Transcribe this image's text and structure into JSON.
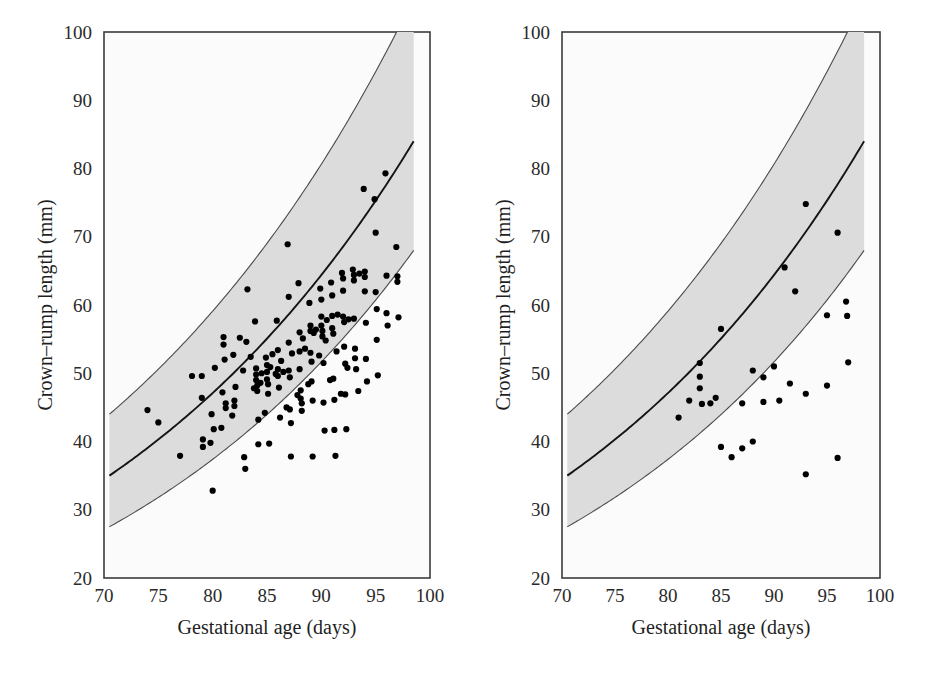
{
  "figure": {
    "background_color": "#ffffff",
    "panel_count": 2
  },
  "chart_data": [
    {
      "type": "scatter",
      "panel": "left",
      "title": "",
      "xlabel": "Gestational age (days)",
      "ylabel": "Crown–rump length (mm)",
      "xlim": [
        70,
        100
      ],
      "ylim": [
        20,
        100
      ],
      "xticks": [
        70,
        75,
        80,
        85,
        90,
        95,
        100
      ],
      "yticks": [
        20,
        30,
        40,
        50,
        60,
        70,
        80,
        90,
        100
      ],
      "grid": false,
      "legend": "none",
      "band": {
        "label": "reference centile band",
        "fill_color": "#dcdcdc",
        "edge_color": "#4a4a4a",
        "median_color": "#141414",
        "x_start": 70.5,
        "x_end": 98.5,
        "median_start": 35,
        "median_end": 84,
        "upper_start": 44,
        "upper_end": 105,
        "lower_start": 27.5,
        "lower_end": 68
      },
      "series": [
        {
          "name": "observations",
          "marker": "filled-circle",
          "color": "#000000",
          "points": [
            [
              74.0,
              44.6
            ],
            [
              75.0,
              42.8
            ],
            [
              77.0,
              37.9
            ],
            [
              78.1,
              49.6
            ],
            [
              79.0,
              49.6
            ],
            [
              79.0,
              46.4
            ],
            [
              79.1,
              40.3
            ],
            [
              79.1,
              39.2
            ],
            [
              79.9,
              44.0
            ],
            [
              80.0,
              32.8
            ],
            [
              80.1,
              41.8
            ],
            [
              80.2,
              50.8
            ],
            [
              80.9,
              47.2
            ],
            [
              81.0,
              55.3
            ],
            [
              81.0,
              54.2
            ],
            [
              81.1,
              52.0
            ],
            [
              81.2,
              45.6
            ],
            [
              81.2,
              44.9
            ],
            [
              81.9,
              52.7
            ],
            [
              82.0,
              46.0
            ],
            [
              82.0,
              45.2
            ],
            [
              82.1,
              48.0
            ],
            [
              82.9,
              37.7
            ],
            [
              83.0,
              36.0
            ],
            [
              83.1,
              54.6
            ],
            [
              83.2,
              62.3
            ],
            [
              83.9,
              57.6
            ],
            [
              84.0,
              50.7
            ],
            [
              84.0,
              49.8
            ],
            [
              84.0,
              49.0
            ],
            [
              84.1,
              48.2
            ],
            [
              84.1,
              47.4
            ],
            [
              84.2,
              43.2
            ],
            [
              84.2,
              39.6
            ],
            [
              84.9,
              52.3
            ],
            [
              85.0,
              51.2
            ],
            [
              85.0,
              50.2
            ],
            [
              85.0,
              49.1
            ],
            [
              85.1,
              48.4
            ],
            [
              85.1,
              47.0
            ],
            [
              85.2,
              39.7
            ],
            [
              85.9,
              57.7
            ],
            [
              86.0,
              53.4
            ],
            [
              86.0,
              50.6
            ],
            [
              86.0,
              49.6
            ],
            [
              86.1,
              47.9
            ],
            [
              86.2,
              43.5
            ],
            [
              86.9,
              68.9
            ],
            [
              87.0,
              61.2
            ],
            [
              87.0,
              54.5
            ],
            [
              87.0,
              50.4
            ],
            [
              87.1,
              49.4
            ],
            [
              87.1,
              44.7
            ],
            [
              87.2,
              42.7
            ],
            [
              87.2,
              37.8
            ],
            [
              87.9,
              63.2
            ],
            [
              88.0,
              56.0
            ],
            [
              88.0,
              53.2
            ],
            [
              88.0,
              50.6
            ],
            [
              88.1,
              47.5
            ],
            [
              88.1,
              46.3
            ],
            [
              88.2,
              45.6
            ],
            [
              88.2,
              44.5
            ],
            [
              88.9,
              60.3
            ],
            [
              89.0,
              57.0
            ],
            [
              89.0,
              56.2
            ],
            [
              89.0,
              53.0
            ],
            [
              89.1,
              51.7
            ],
            [
              89.1,
              48.8
            ],
            [
              89.2,
              46.0
            ],
            [
              89.2,
              37.8
            ],
            [
              89.9,
              62.4
            ],
            [
              90.0,
              60.8
            ],
            [
              90.0,
              58.3
            ],
            [
              90.0,
              57.0
            ],
            [
              90.1,
              56.2
            ],
            [
              90.1,
              55.4
            ],
            [
              90.2,
              51.5
            ],
            [
              90.2,
              45.7
            ],
            [
              90.3,
              41.6
            ],
            [
              90.9,
              63.3
            ],
            [
              91.0,
              61.4
            ],
            [
              91.0,
              58.4
            ],
            [
              91.0,
              56.6
            ],
            [
              91.1,
              55.8
            ],
            [
              91.1,
              49.2
            ],
            [
              91.2,
              46.1
            ],
            [
              91.2,
              41.7
            ],
            [
              91.3,
              37.9
            ],
            [
              91.9,
              64.7
            ],
            [
              92.0,
              63.9
            ],
            [
              92.0,
              62.1
            ],
            [
              92.0,
              58.3
            ],
            [
              92.1,
              57.5
            ],
            [
              92.1,
              53.9
            ],
            [
              92.2,
              51.4
            ],
            [
              92.2,
              46.9
            ],
            [
              92.3,
              41.8
            ],
            [
              92.9,
              65.2
            ],
            [
              93.0,
              64.4
            ],
            [
              93.0,
              63.6
            ],
            [
              93.0,
              58.0
            ],
            [
              93.1,
              53.6
            ],
            [
              93.1,
              52.2
            ],
            [
              93.2,
              50.6
            ],
            [
              93.9,
              77.0
            ],
            [
              94.0,
              64.9
            ],
            [
              94.0,
              64.1
            ],
            [
              94.0,
              62.0
            ],
            [
              94.1,
              57.4
            ],
            [
              94.1,
              52.1
            ],
            [
              94.2,
              48.8
            ],
            [
              94.9,
              75.5
            ],
            [
              95.0,
              70.6
            ],
            [
              95.0,
              61.9
            ],
            [
              95.1,
              59.4
            ],
            [
              95.1,
              54.9
            ],
            [
              95.2,
              49.7
            ],
            [
              95.9,
              79.3
            ],
            [
              96.0,
              64.3
            ],
            [
              96.0,
              58.8
            ],
            [
              96.1,
              57.0
            ],
            [
              96.9,
              68.5
            ],
            [
              97.0,
              64.2
            ],
            [
              97.0,
              63.4
            ],
            [
              97.1,
              58.2
            ],
            [
              82.5,
              55.2
            ],
            [
              83.5,
              52.4
            ],
            [
              84.5,
              50.0
            ],
            [
              85.5,
              52.8
            ],
            [
              86.5,
              50.2
            ],
            [
              88.5,
              53.6
            ],
            [
              89.5,
              56.4
            ],
            [
              90.5,
              57.8
            ],
            [
              91.5,
              58.6
            ],
            [
              92.5,
              57.9
            ],
            [
              93.5,
              64.6
            ],
            [
              86.8,
              45.0
            ],
            [
              87.8,
              46.8
            ],
            [
              84.8,
              44.2
            ],
            [
              83.8,
              47.8
            ],
            [
              82.8,
              50.4
            ],
            [
              81.8,
              43.8
            ],
            [
              80.8,
              42.0
            ],
            [
              79.8,
              39.8
            ],
            [
              90.8,
              49.0
            ],
            [
              91.8,
              47.0
            ],
            [
              89.8,
              52.6
            ],
            [
              88.8,
              48.4
            ],
            [
              85.8,
              49.9
            ],
            [
              84.4,
              48.6
            ],
            [
              85.3,
              50.9
            ],
            [
              86.3,
              51.8
            ],
            [
              87.3,
              52.9
            ],
            [
              88.3,
              55.1
            ],
            [
              89.3,
              55.9
            ],
            [
              90.4,
              54.8
            ],
            [
              91.4,
              53.2
            ],
            [
              92.4,
              50.8
            ],
            [
              93.4,
              47.4
            ]
          ]
        }
      ]
    },
    {
      "type": "scatter",
      "panel": "right",
      "title": "",
      "xlabel": "Gestational age (days)",
      "ylabel": "Crown–rump length (mm)",
      "xlim": [
        70,
        100
      ],
      "ylim": [
        20,
        100
      ],
      "xticks": [
        70,
        75,
        80,
        85,
        90,
        95,
        100
      ],
      "yticks": [
        20,
        30,
        40,
        50,
        60,
        70,
        80,
        90,
        100
      ],
      "grid": false,
      "legend": "none",
      "band": {
        "label": "reference centile band",
        "fill_color": "#dcdcdc",
        "edge_color": "#4a4a4a",
        "median_color": "#141414",
        "x_start": 70.5,
        "x_end": 98.5,
        "median_start": 35,
        "median_end": 84,
        "upper_start": 44,
        "upper_end": 105,
        "lower_start": 27.5,
        "lower_end": 68
      },
      "series": [
        {
          "name": "observations",
          "marker": "filled-circle",
          "color": "#000000",
          "points": [
            [
              81.0,
              43.5
            ],
            [
              82.0,
              46.0
            ],
            [
              83.0,
              51.5
            ],
            [
              83.0,
              49.5
            ],
            [
              83.0,
              47.8
            ],
            [
              83.2,
              45.5
            ],
            [
              84.0,
              45.6
            ],
            [
              85.0,
              56.5
            ],
            [
              85.0,
              39.2
            ],
            [
              86.0,
              37.7
            ],
            [
              87.0,
              45.6
            ],
            [
              87.0,
              39.0
            ],
            [
              88.0,
              50.4
            ],
            [
              88.0,
              40.0
            ],
            [
              89.0,
              49.4
            ],
            [
              89.0,
              45.8
            ],
            [
              90.0,
              51.0
            ],
            [
              91.0,
              65.5
            ],
            [
              91.5,
              48.5
            ],
            [
              92.0,
              62.0
            ],
            [
              93.0,
              74.8
            ],
            [
              93.0,
              47.0
            ],
            [
              93.0,
              35.2
            ],
            [
              95.0,
              58.5
            ],
            [
              95.0,
              48.2
            ],
            [
              96.0,
              70.6
            ],
            [
              96.0,
              37.6
            ],
            [
              96.8,
              60.5
            ],
            [
              96.9,
              58.4
            ],
            [
              97.0,
              51.6
            ],
            [
              84.5,
              46.4
            ],
            [
              90.5,
              46.0
            ]
          ]
        }
      ]
    }
  ],
  "panels": [
    {
      "id": "left",
      "xlabel": "Gestational age (days)",
      "ylabel": "Crown–rump length (mm)",
      "xticks": [
        "70",
        "75",
        "80",
        "85",
        "90",
        "95",
        "100"
      ],
      "yticks": [
        "100",
        "90",
        "80",
        "70",
        "60",
        "50",
        "40",
        "30",
        "20"
      ]
    },
    {
      "id": "right",
      "xlabel": "Gestational age (days)",
      "ylabel": "Crown–rump length (mm)",
      "xticks": [
        "70",
        "75",
        "80",
        "85",
        "90",
        "95",
        "100"
      ],
      "yticks": [
        "100",
        "90",
        "80",
        "70",
        "60",
        "50",
        "40",
        "30",
        "20"
      ]
    }
  ]
}
